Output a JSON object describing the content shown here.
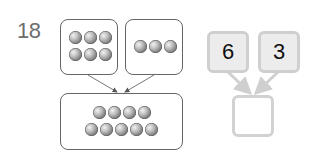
{
  "question": {
    "number": "18"
  },
  "left_diagram": {
    "top_left_box": {
      "ball_count": 6,
      "rows": [
        3,
        3
      ]
    },
    "top_right_box": {
      "ball_count": 3,
      "rows": [
        3
      ]
    },
    "bottom_box": {
      "ball_count": 9,
      "rows": [
        4,
        5
      ]
    }
  },
  "right_diagram": {
    "left_number": "6",
    "right_number": "3",
    "answer": ""
  },
  "colors": {
    "number_box_fill": "#ececec",
    "number_box_border": "#cfcfcf",
    "answer_box_border": "#d2d2d2",
    "line_color": "#666666",
    "question_number_color": "#6e6e6e"
  }
}
